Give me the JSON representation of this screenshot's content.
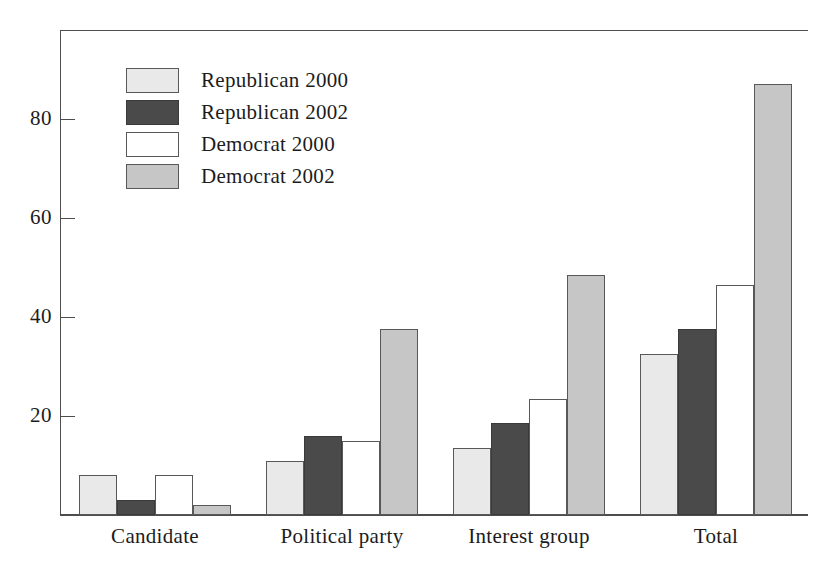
{
  "chart_data": {
    "type": "bar",
    "title": "",
    "xlabel": "",
    "ylabel": "",
    "categories": [
      "Candidate",
      "Political party",
      "Interest group",
      "Total"
    ],
    "series": [
      {
        "name": "Republican 2000",
        "color": "#e9e9e9",
        "values": [
          8,
          11,
          13.5,
          32.5
        ]
      },
      {
        "name": "Republican 2002",
        "color": "#4a4a4a",
        "values": [
          3,
          16,
          18.5,
          37.5
        ]
      },
      {
        "name": "Democrat 2000",
        "color": "#ffffff",
        "values": [
          8,
          15,
          23.5,
          46.5
        ]
      },
      {
        "name": "Democrat 2002",
        "color": "#c6c6c6",
        "values": [
          2,
          37.5,
          48.5,
          87
        ]
      }
    ],
    "ylim": [
      0,
      98
    ],
    "yticks": [
      20,
      40,
      60,
      80
    ],
    "ytick_labels": [
      "20",
      "40",
      "60",
      "80"
    ],
    "grid": false,
    "legend_position": "top-left",
    "axis_color": "#4d4d4d",
    "bar_outline_color": "#585858"
  }
}
